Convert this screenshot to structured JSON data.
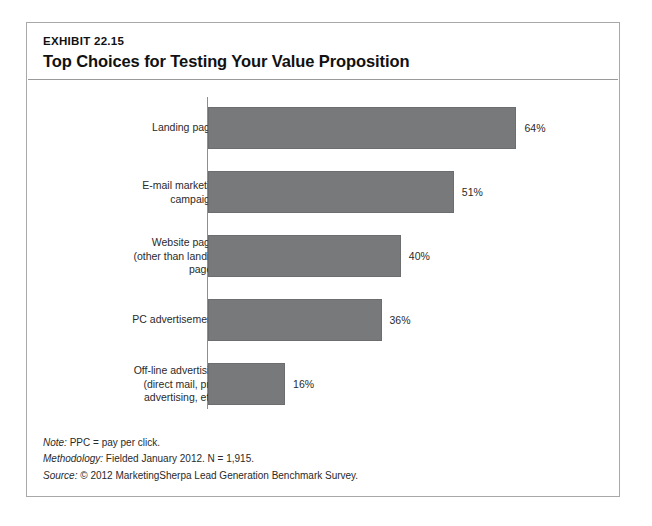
{
  "exhibit": {
    "number": "EXHIBIT 22.15",
    "title": "Top Choices for Testing Your Value Proposition"
  },
  "footnotes": [
    {
      "label": "Note:",
      "text": " PPC = pay per click."
    },
    {
      "label": "Methodology:",
      "text": " Fielded January 2012. N = 1,915."
    },
    {
      "label": "Source:",
      "text": " © 2012 MarketingSherpa Lead Generation Benchmark Survey."
    }
  ],
  "colors": {
    "bar_fill": "#77797a",
    "bar_stroke": "#6b6d6e",
    "frame": "#a8a8a8",
    "axis": "#8e8e8e",
    "text": "#2a2a2a"
  },
  "chart_data": {
    "type": "bar",
    "orientation": "horizontal",
    "title": "Top Choices for Testing Your Value Proposition",
    "xlabel": "",
    "ylabel": "",
    "xlim": [
      0,
      70
    ],
    "grid": false,
    "legend": "none",
    "value_suffix": "%",
    "categories": [
      "Landing pages",
      "E-mail marketing campaigns",
      "Website pages (other than landing pages)",
      "PC advertisements",
      "Off-line advertising (direct mail, print advertising, etc.)"
    ],
    "category_lines": [
      [
        "Landing pages"
      ],
      [
        "E-mail marketing",
        "campaigns"
      ],
      [
        "Website pages",
        "(other than landing",
        "pages)"
      ],
      [
        "PC advertisements"
      ],
      [
        "Off-line advertising",
        "(direct mail, print",
        "advertising, etc.)"
      ]
    ],
    "values": [
      64,
      51,
      40,
      36,
      16
    ],
    "value_labels": [
      "64%",
      "51%",
      "40%",
      "36%",
      "16%"
    ]
  }
}
